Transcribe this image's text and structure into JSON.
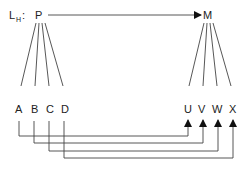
{
  "diagram": {
    "title_label": "L",
    "title_subscript": "H",
    "title_colon": ":",
    "source_node": "P",
    "target_node": "M",
    "left_nodes": [
      "A",
      "B",
      "C",
      "D"
    ],
    "right_nodes": [
      "U",
      "V",
      "W",
      "X"
    ],
    "edges": [
      {
        "from": "P",
        "to": "M",
        "type": "arrow"
      },
      {
        "from": "A",
        "to": "U",
        "type": "arrow"
      },
      {
        "from": "B",
        "to": "V",
        "type": "arrow"
      },
      {
        "from": "C",
        "to": "W",
        "type": "arrow"
      },
      {
        "from": "D",
        "to": "X",
        "type": "arrow"
      }
    ],
    "line_color": "#444444",
    "text_color": "#222222"
  }
}
